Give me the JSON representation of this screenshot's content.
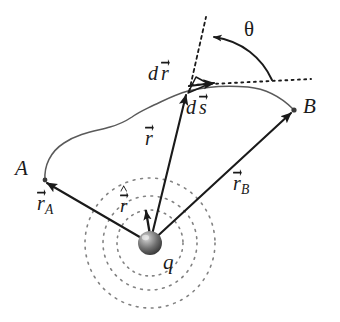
{
  "figure": {
    "type": "physics-vector-diagram",
    "background_color": "#ffffff",
    "ink_color": "#1a1a1a",
    "path_color": "#555555",
    "dashed_circle_color": "#777777"
  },
  "labels": {
    "point_a": "A",
    "point_b": "B",
    "charge": "q",
    "theta": "θ",
    "vector_r": "r",
    "vector_r_a_base": "r",
    "vector_r_a_sub": "A",
    "vector_r_b_base": "r",
    "vector_r_b_sub": "B",
    "d_prefix": "d",
    "dr_base": "r",
    "ds_base": "s",
    "unit_r": "r"
  },
  "geometry": {
    "charge_center": {
      "x": 150,
      "y": 243
    },
    "charge_radius": 12,
    "point_a": {
      "x": 42,
      "y": 180
    },
    "point_b": {
      "x": 296,
      "y": 110
    },
    "dr_point": {
      "x": 188,
      "y": 93
    },
    "dashed_circle_radii": [
      33,
      47,
      65
    ],
    "radial_dashed_line": {
      "x1": 206,
      "y1": 17,
      "x2": 189,
      "y2": 92
    },
    "tangent_dotted_line": {
      "x1": 190,
      "y1": 85,
      "x2": 311,
      "y2": 79
    },
    "theta_arc_start": {
      "x": 212,
      "y": 38
    },
    "theta_arc_end": {
      "x": 274,
      "y": 80
    },
    "unit_vector_r_tip": {
      "x": 147,
      "y": 208
    },
    "ds_vector": {
      "x1": 189,
      "y1": 86,
      "x2": 216,
      "y2": 83
    }
  },
  "label_positions": {
    "point_a": {
      "x": 15,
      "y": 158
    },
    "point_b": {
      "x": 303,
      "y": 96
    },
    "charge": {
      "x": 163,
      "y": 252
    },
    "theta": {
      "x": 244,
      "y": 19
    },
    "vector_r": {
      "x": 145,
      "y": 128
    },
    "vector_r_a": {
      "x": 37,
      "y": 193
    },
    "vector_r_b": {
      "x": 233,
      "y": 173
    },
    "dr": {
      "x": 148,
      "y": 63
    },
    "ds": {
      "x": 186,
      "y": 97
    },
    "unit_r": {
      "x": 120,
      "y": 196
    }
  }
}
